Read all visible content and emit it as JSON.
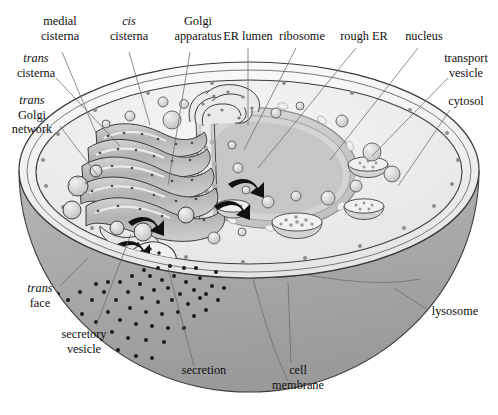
{
  "figure": {
    "type": "labeled-biological-diagram",
    "background_color": "#ffffff"
  },
  "palette": {
    "cell_upper_rim": "#f2f2f2",
    "cytosol": "#ededed",
    "lower_hemisphere": "#a9a9a9",
    "lower_hemisphere_dark": "#9c9c9c",
    "membrane_line": "#3a3a3a",
    "golgi_fill": "#b9b9b9",
    "golgi_light": "#e4e4e4",
    "nucleus_fill": "#cfcfcf",
    "nucleus_envelope": "#bdbdbd",
    "er_fill": "#d8d8d8",
    "vesicle_fill": "#d5d5d5",
    "lysosome_fill": "#e0e0e0",
    "secretion_dot": "#1d1d1d",
    "leader_line": "#6a6a6a",
    "text": "#101010"
  },
  "labels": [
    {
      "id": "medial-cisterna",
      "lines": [
        "medial",
        "cisterna"
      ],
      "italic_lines": [],
      "x": 60,
      "y": 25,
      "anchor": "middle",
      "leader": [
        [
          62,
          52
        ],
        [
          96,
          133
        ]
      ]
    },
    {
      "id": "cis-cisterna",
      "lines": [
        "cis",
        "cisterna"
      ],
      "italic_lines": [
        0
      ],
      "x": 129,
      "y": 25,
      "anchor": "middle",
      "leader": [
        [
          129,
          52
        ],
        [
          150,
          125
        ]
      ]
    },
    {
      "id": "golgi-apparatus",
      "lines": [
        "Golgi",
        "apparatus"
      ],
      "italic_lines": [],
      "x": 198,
      "y": 25,
      "anchor": "middle",
      "leader": [
        [
          190,
          52
        ],
        [
          168,
          185
        ]
      ]
    },
    {
      "id": "er-lumen",
      "lines": [
        "ER lumen"
      ],
      "italic_lines": [],
      "x": 248,
      "y": 40,
      "anchor": "middle",
      "leader": [
        [
          248,
          48
        ],
        [
          248,
          125
        ]
      ]
    },
    {
      "id": "ribosome",
      "lines": [
        "ribosome"
      ],
      "italic_lines": [],
      "x": 302,
      "y": 40,
      "anchor": "middle",
      "leader": [
        [
          296,
          48
        ],
        [
          244,
          150
        ]
      ]
    },
    {
      "id": "rough-er",
      "lines": [
        "rough ER"
      ],
      "italic_lines": [],
      "x": 364,
      "y": 40,
      "anchor": "middle",
      "leader": [
        [
          356,
          48
        ],
        [
          258,
          168
        ]
      ]
    },
    {
      "id": "nucleus",
      "lines": [
        "nucleus"
      ],
      "italic_lines": [],
      "x": 424,
      "y": 40,
      "anchor": "middle",
      "leader": [
        [
          418,
          48
        ],
        [
          330,
          160
        ]
      ]
    },
    {
      "id": "transport-vesicle",
      "lines": [
        "transport",
        "vesicle"
      ],
      "italic_lines": [],
      "x": 466,
      "y": 62,
      "anchor": "middle",
      "leader": [
        [
          448,
          78
        ],
        [
          372,
          156
        ]
      ]
    },
    {
      "id": "cytosol",
      "lines": [
        "cytosol"
      ],
      "italic_lines": [],
      "x": 466,
      "y": 105,
      "anchor": "middle",
      "leader": [
        [
          450,
          110
        ],
        [
          398,
          186
        ]
      ]
    },
    {
      "id": "trans-cisterna",
      "lines": [
        "trans",
        "cisterna"
      ],
      "italic_lines": [
        0
      ],
      "x": 36,
      "y": 62,
      "anchor": "middle",
      "leader": [
        [
          56,
          78
        ],
        [
          120,
          146
        ]
      ]
    },
    {
      "id": "trans-golgi-network",
      "lines": [
        "trans",
        "Golgi",
        "network"
      ],
      "italic_lines": [
        0
      ],
      "x": 32,
      "y": 104,
      "anchor": "middle",
      "leader": [
        [
          60,
          126
        ],
        [
          98,
          176
        ]
      ]
    },
    {
      "id": "trans-face",
      "lines": [
        "trans",
        "face"
      ],
      "italic_lines": [
        0
      ],
      "x": 40,
      "y": 292,
      "anchor": "middle",
      "leader": [
        [
          60,
          286
        ],
        [
          88,
          258
        ]
      ]
    },
    {
      "id": "secretory-vesicle",
      "lines": [
        "secretory",
        "vesicle"
      ],
      "italic_lines": [],
      "x": 84,
      "y": 338,
      "anchor": "middle",
      "leader": [
        [
          96,
          326
        ],
        [
          131,
          234
        ]
      ]
    },
    {
      "id": "secretion",
      "lines": [
        "secretion"
      ],
      "italic_lines": [],
      "x": 204,
      "y": 374,
      "anchor": "middle",
      "leader": [
        [
          194,
          366
        ],
        [
          168,
          268
        ]
      ]
    },
    {
      "id": "cell-membrane",
      "lines": [
        "cell",
        "membrane"
      ],
      "italic_lines": [],
      "x": 298,
      "y": 374,
      "anchor": "middle",
      "leader": [
        [
          291,
          362
        ],
        [
          288,
          282
        ]
      ]
    },
    {
      "id": "lysosome",
      "lines": [
        "lysosome"
      ],
      "italic_lines": [],
      "x": 455,
      "y": 315,
      "anchor": "middle",
      "leader": [
        [
          428,
          310
        ],
        [
          394,
          288
        ]
      ]
    }
  ],
  "structures": [
    {
      "id": "cell-body",
      "name": "cell body",
      "count": 1
    },
    {
      "id": "cell-membrane",
      "name": "cell membrane cut edge",
      "count": 1
    },
    {
      "id": "golgi-stack",
      "name": "Golgi cisternae stack",
      "count": 5
    },
    {
      "id": "nucleus",
      "name": "nucleus dome",
      "count": 1
    },
    {
      "id": "rough-er",
      "name": "rough ER tubules",
      "count": 1
    },
    {
      "id": "lysosome",
      "name": "lysosome",
      "count": 3
    },
    {
      "id": "transport-vesicle",
      "name": "transport vesicle",
      "count": 12
    },
    {
      "id": "secretory-vesicle",
      "name": "secretory vesicle",
      "count": 4
    },
    {
      "id": "secretion-dots",
      "name": "secreted particles",
      "count": 92
    },
    {
      "id": "budding-arrow",
      "name": "vesicle budding arrow",
      "count": 4
    }
  ]
}
